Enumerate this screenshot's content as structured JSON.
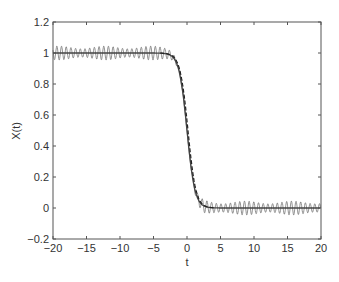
{
  "chart_data": {
    "type": "line",
    "title": "",
    "xlabel": "t",
    "ylabel": "X(t)",
    "xlim": [
      -20,
      20
    ],
    "ylim": [
      -0.2,
      1.2
    ],
    "xticks": [
      -20,
      -15,
      -10,
      -5,
      0,
      5,
      10,
      15,
      20
    ],
    "xtick_labels": [
      "−20",
      "−15",
      "−10",
      "−5",
      "0",
      "5",
      "10",
      "15",
      "20"
    ],
    "yticks": [
      -0.2,
      0,
      0.2,
      0.4,
      0.6,
      0.8,
      1,
      1.2
    ],
    "ytick_labels": [
      "−0.2",
      "0",
      "0.2",
      "0.4",
      "0.6",
      "0.8",
      "1",
      "1.2"
    ],
    "grid": false,
    "legend": null,
    "series": [
      {
        "name": "smooth kink solution",
        "style": "solid",
        "color": "#444444",
        "description": "Smooth front: X(t) ≈ 1 for t < -2, steep decrease through ~0.5 at t ≈ 0, ≈ 0 for t > 3",
        "x": [
          -20,
          -10,
          -4,
          -2,
          -1,
          0,
          1,
          2,
          3,
          5,
          10,
          20
        ],
        "values": [
          1.0,
          1.0,
          1.0,
          0.98,
          0.85,
          0.5,
          0.2,
          0.06,
          0.02,
          0.0,
          0.0,
          0.0
        ]
      },
      {
        "name": "oscillating solution",
        "style": "solid-thin",
        "color": "#777777",
        "description": "Same front with superimposed fast oscillations of amplitude ~0.045 and period ~0.7 on both plateaus",
        "amplitude": 0.045,
        "period": 0.7
      },
      {
        "name": "dashed approximation",
        "style": "dashed",
        "color": "#222222",
        "description": "Dashed curve overlaying the smooth front, visible mainly in the transition region",
        "x": [
          -3,
          -2,
          -1,
          0,
          1,
          2,
          3
        ],
        "values": [
          1.0,
          0.97,
          0.84,
          0.5,
          0.2,
          0.07,
          0.02
        ]
      }
    ]
  }
}
